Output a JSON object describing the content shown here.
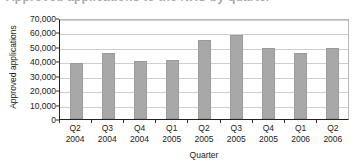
{
  "figure": {
    "caption": "Approved applications to the NHS by quarter",
    "caption_visible_note": "cropped"
  },
  "chart_data": {
    "type": "bar",
    "title": "Approved applications to the NHS by quarter",
    "xlabel": "Quarter",
    "ylabel": "Approved applications",
    "categories": [
      "Q2 2004",
      "Q3 2004",
      "Q4 2004",
      "Q1 2005",
      "Q2 2005",
      "Q3 2005",
      "Q4 2005",
      "Q1 2006",
      "Q2 2006"
    ],
    "category_lines": [
      {
        "quarter": "Q2",
        "year": "2004"
      },
      {
        "quarter": "Q3",
        "year": "2004"
      },
      {
        "quarter": "Q4",
        "year": "2004"
      },
      {
        "quarter": "Q1",
        "year": "2005"
      },
      {
        "quarter": "Q2",
        "year": "2005"
      },
      {
        "quarter": "Q3",
        "year": "2005"
      },
      {
        "quarter": "Q4",
        "year": "2005"
      },
      {
        "quarter": "Q1",
        "year": "2006"
      },
      {
        "quarter": "Q2",
        "year": "2006"
      }
    ],
    "values": [
      38500,
      46000,
      40000,
      41000,
      54500,
      58000,
      49000,
      45500,
      49500
    ],
    "ylim": [
      0,
      70000
    ],
    "ytick_values": [
      0,
      10000,
      20000,
      30000,
      40000,
      50000,
      60000,
      70000
    ],
    "ytick_labels": [
      "0",
      "10,000",
      "20,000",
      "30,000",
      "40,000",
      "50,000",
      "60,000",
      "70,000"
    ],
    "grid": true,
    "legend": null,
    "bar_color": "#a8a8a8",
    "gridline_color": "#cfcfcf",
    "axis_color": "#222222"
  }
}
